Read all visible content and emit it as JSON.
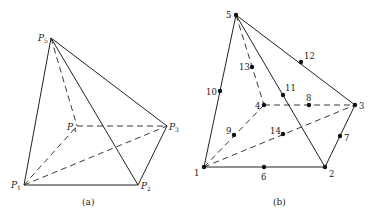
{
  "panel_a": {
    "caption": "(a)",
    "vertices": [
      {
        "id": "P1",
        "label": "P",
        "sub": "1",
        "x": 24,
        "y": 185
      },
      {
        "id": "P2",
        "label": "P",
        "sub": "2",
        "x": 138,
        "y": 185
      },
      {
        "id": "P3",
        "label": "P",
        "sub": "3",
        "x": 167,
        "y": 126
      },
      {
        "id": "P4",
        "label": "P",
        "sub": "4",
        "x": 77,
        "y": 126
      },
      {
        "id": "P5",
        "label": "P",
        "sub": "5",
        "x": 51,
        "y": 38
      }
    ],
    "solid_edges": [
      [
        "P1",
        "P2"
      ],
      [
        "P2",
        "P3"
      ],
      [
        "P5",
        "P1"
      ],
      [
        "P5",
        "P2"
      ],
      [
        "P5",
        "P3"
      ]
    ],
    "dashed_edges": [
      [
        "P1",
        "P4"
      ],
      [
        "P4",
        "P3"
      ],
      [
        "P1",
        "P3"
      ],
      [
        "P5",
        "P4"
      ]
    ]
  },
  "panel_b": {
    "caption": "(b)",
    "nodes": [
      {
        "label": "1",
        "x": 204,
        "y": 167
      },
      {
        "label": "2",
        "x": 325,
        "y": 167
      },
      {
        "label": "3",
        "x": 355,
        "y": 105
      },
      {
        "label": "4",
        "x": 264,
        "y": 105
      },
      {
        "label": "5",
        "x": 236,
        "y": 15
      },
      {
        "label": "6",
        "x": 264,
        "y": 167
      },
      {
        "label": "7",
        "x": 341,
        "y": 136
      },
      {
        "label": "8",
        "x": 310,
        "y": 105
      },
      {
        "label": "9",
        "x": 234,
        "y": 135
      },
      {
        "label": "10",
        "x": 220,
        "y": 91
      },
      {
        "label": "11",
        "x": 283,
        "y": 94
      },
      {
        "label": "12",
        "x": 301,
        "y": 62
      },
      {
        "label": "13",
        "x": 252,
        "y": 67
      },
      {
        "label": "14",
        "x": 283,
        "y": 134
      }
    ],
    "solid_edges": [
      [
        "1",
        "2"
      ],
      [
        "2",
        "3"
      ],
      [
        "5",
        "1"
      ],
      [
        "5",
        "2"
      ],
      [
        "5",
        "3"
      ]
    ],
    "dashed_edges": [
      [
        "1",
        "4"
      ],
      [
        "4",
        "3"
      ],
      [
        "1",
        "3"
      ],
      [
        "5",
        "4"
      ]
    ]
  }
}
